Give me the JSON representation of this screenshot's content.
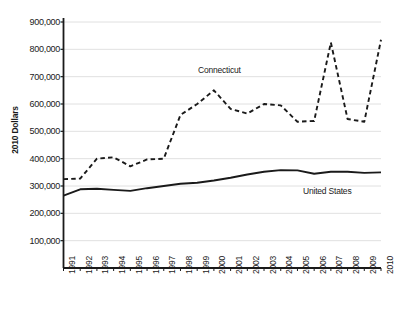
{
  "chart_data": {
    "type": "line",
    "title": "",
    "xlabel": "",
    "ylabel": "2010 Dollars",
    "x": [
      1991,
      1992,
      1993,
      1994,
      1995,
      1996,
      1997,
      1998,
      1999,
      2000,
      2001,
      2002,
      2003,
      2004,
      2005,
      2006,
      2007,
      2008,
      2009,
      2010
    ],
    "categories": [
      "1991",
      "1992",
      "1993",
      "1994",
      "1995",
      "1996",
      "1997",
      "1998",
      "1999",
      "2000",
      "2001",
      "2002",
      "2003",
      "2004",
      "2005",
      "2006",
      "2007",
      "2008",
      "2009",
      "2010"
    ],
    "yticks": [
      100000,
      200000,
      300000,
      400000,
      500000,
      600000,
      700000,
      800000,
      900000
    ],
    "ytick_labels": [
      "100,000",
      "200,000",
      "300,000",
      "400,000",
      "500,000",
      "600,000",
      "700,000",
      "800,000",
      "900,000"
    ],
    "ylim": [
      0,
      900000
    ],
    "xlim": [
      1991,
      2010
    ],
    "grid": true,
    "legend_position": "inline-annotation",
    "series": [
      {
        "name": "Connecticut",
        "style": "dashed",
        "color": "#1a1a1a",
        "values": [
          325000,
          327000,
          400000,
          405000,
          372000,
          397000,
          400000,
          560000,
          600000,
          650000,
          582000,
          565000,
          600000,
          595000,
          535000,
          538000,
          825000,
          545000,
          535000,
          835000
        ]
      },
      {
        "name": "United States",
        "style": "solid",
        "color": "#1a1a1a",
        "values": [
          265000,
          288000,
          290000,
          286000,
          282000,
          292000,
          300000,
          308000,
          312000,
          320000,
          330000,
          342000,
          352000,
          358000,
          357000,
          345000,
          352000,
          352000,
          348000,
          350000
        ]
      }
    ]
  },
  "series_labels": {
    "connecticut": "Connecticut",
    "united_states": "United States"
  }
}
